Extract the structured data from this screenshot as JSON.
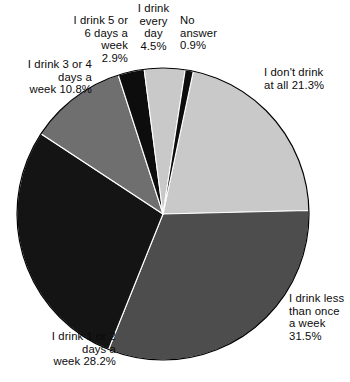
{
  "chart_data": {
    "type": "pie",
    "title": "",
    "subtitle": "",
    "xlabel": "",
    "ylabel": "",
    "legend_position": "none",
    "grid": false,
    "units": "percent",
    "total": 100.1,
    "start_angle_deg": 12,
    "direction": "clockwise",
    "categories": [
      "I don't drink at all",
      "I drink less than once a week",
      "I drink 1 or 2 days a week",
      "I drink 3 or 4 days a week",
      "I drink 5 or 6 days a week",
      "I drink every day",
      "No answer"
    ],
    "values": [
      21.3,
      31.5,
      28.2,
      10.8,
      2.9,
      4.5,
      0.9
    ],
    "slice_colors": [
      "#c9c9c9",
      "#4d4d4d",
      "#141414",
      "#6f6f6f",
      "#0d0d0d",
      "#c9c9c9",
      "#0d0d0d"
    ],
    "slices": [
      {
        "label": "I don't drink at all",
        "value": 21.3,
        "value_text": "21.3%",
        "color": "#c9c9c9"
      },
      {
        "label": "I drink less than once a week",
        "value": 31.5,
        "value_text": "31.5%",
        "color": "#4d4d4d"
      },
      {
        "label": "I drink 1 or 2 days a week",
        "value": 28.2,
        "value_text": "28.2%",
        "color": "#141414"
      },
      {
        "label": "I drink 3 or 4 days a week",
        "value": 10.8,
        "value_text": "10.8%",
        "color": "#6f6f6f"
      },
      {
        "label": "I drink 5 or 6 days a week",
        "value": 2.9,
        "value_text": "2.9%",
        "color": "#0d0d0d"
      },
      {
        "label": "I drink every day",
        "value": 4.5,
        "value_text": "4.5%",
        "color": "#c9c9c9"
      },
      {
        "label": "No answer",
        "value": 0.9,
        "value_text": "0.9%",
        "color": "#0d0d0d"
      }
    ]
  },
  "labels": {
    "no_drink_at_all": "I don't drink\nat all 21.3%",
    "less_than_once": "I drink less\nthan once\na week\n31.5%",
    "one_or_two": "I drink 1 or 2\ndays a\nweek 28.2%",
    "three_or_four": "I drink 3 or 4\ndays a\nweek 10.8%",
    "five_or_six": "I drink 5 or\n6 days a\nweek\n2.9%",
    "every_day": "I drink\nevery\nday\n4.5%",
    "no_answer": "No\nanswer\n0.9%"
  },
  "geometry": {
    "center_x": 163,
    "center_y": 214,
    "radius": 146
  }
}
